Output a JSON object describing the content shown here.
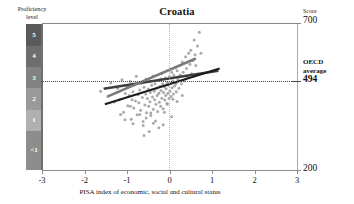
{
  "chart_data": {
    "type": "scatter",
    "title": "Croatia",
    "xlabel": "PISA index of economic, social and cultural status",
    "ylabel": "Score",
    "xlim": [
      -3,
      3
    ],
    "ylim": [
      200,
      700
    ],
    "grid": false,
    "legend": "none",
    "xticks": [
      "-3",
      "-2",
      "-1",
      "0",
      "1",
      "2",
      "3"
    ],
    "xtick_values": [
      -3,
      -2,
      -1,
      0,
      1,
      2,
      3
    ],
    "yticks": [
      "700",
      "494",
      "200"
    ],
    "ytick_values": [
      700,
      494,
      200
    ],
    "annotations": {
      "oecd_average_line": 494,
      "zero_reference_line": 0
    },
    "proficiency_axis_label": "Proficiency level",
    "proficiency_levels": [
      {
        "label": "5",
        "top_score": 700,
        "bottom_score": 626,
        "color": "#5a5a5a"
      },
      {
        "label": "4",
        "top_score": 626,
        "bottom_score": 553,
        "color": "#6e6e6e"
      },
      {
        "label": "3",
        "top_score": 553,
        "bottom_score": 480,
        "color": "#828282"
      },
      {
        "label": "2",
        "top_score": 480,
        "bottom_score": 407,
        "color": "#9a9a9a"
      },
      {
        "label": "1",
        "top_score": 407,
        "bottom_score": 335,
        "color": "#b0b0b0"
      },
      {
        "label": "<1",
        "top_score": 335,
        "bottom_score": 200,
        "color": "#8d8d8d"
      }
    ],
    "series": [
      {
        "name": "students",
        "type": "scatter",
        "marker_color": "#9b9b9b",
        "points": [
          [
            -1.62,
            470
          ],
          [
            -1.45,
            452
          ],
          [
            -1.38,
            498
          ],
          [
            -1.3,
            433
          ],
          [
            -1.22,
            479
          ],
          [
            -1.18,
            441
          ],
          [
            -1.12,
            509
          ],
          [
            -1.08,
            398
          ],
          [
            -1.04,
            462
          ],
          [
            -1.0,
            487
          ],
          [
            -0.98,
            420
          ],
          [
            -0.95,
            455
          ],
          [
            -0.92,
            503
          ],
          [
            -0.9,
            374
          ],
          [
            -0.88,
            441
          ],
          [
            -0.86,
            468
          ],
          [
            -0.84,
            412
          ],
          [
            -0.82,
            492
          ],
          [
            -0.8,
            436
          ],
          [
            -0.78,
            521
          ],
          [
            -0.76,
            389
          ],
          [
            -0.74,
            458
          ],
          [
            -0.72,
            430
          ],
          [
            -0.7,
            474
          ],
          [
            -0.68,
            405
          ],
          [
            -0.66,
            497
          ],
          [
            -0.64,
            448
          ],
          [
            -0.62,
            366
          ],
          [
            -0.6,
            483
          ],
          [
            -0.58,
            423
          ],
          [
            -0.56,
            460
          ],
          [
            -0.55,
            512
          ],
          [
            -0.54,
            396
          ],
          [
            -0.52,
            445
          ],
          [
            -0.5,
            477
          ],
          [
            -0.49,
            418
          ],
          [
            -0.48,
            503
          ],
          [
            -0.46,
            434
          ],
          [
            -0.45,
            465
          ],
          [
            -0.44,
            387
          ],
          [
            -0.42,
            490
          ],
          [
            -0.4,
            450
          ],
          [
            -0.39,
            522
          ],
          [
            -0.38,
            408
          ],
          [
            -0.36,
            470
          ],
          [
            -0.35,
            441
          ],
          [
            -0.34,
            495
          ],
          [
            -0.32,
            425
          ],
          [
            -0.3,
            480
          ],
          [
            -0.29,
            455
          ],
          [
            -0.28,
            400
          ],
          [
            -0.26,
            508
          ],
          [
            -0.25,
            463
          ],
          [
            -0.24,
            432
          ],
          [
            -0.22,
            487
          ],
          [
            -0.21,
            418
          ],
          [
            -0.2,
            472
          ],
          [
            -0.19,
            530
          ],
          [
            -0.18,
            446
          ],
          [
            -0.16,
            495
          ],
          [
            -0.15,
            410
          ],
          [
            -0.14,
            465
          ],
          [
            -0.12,
            485
          ],
          [
            -0.11,
            440
          ],
          [
            -0.1,
            515
          ],
          [
            -0.09,
            455
          ],
          [
            -0.08,
            478
          ],
          [
            -0.06,
            428
          ],
          [
            -0.05,
            500
          ],
          [
            -0.04,
            462
          ],
          [
            -0.02,
            490
          ],
          [
            -0.01,
            445
          ],
          [
            0.0,
            520
          ],
          [
            0.01,
            470
          ],
          [
            0.02,
            498
          ],
          [
            0.04,
            452
          ],
          [
            0.05,
            535
          ],
          [
            0.06,
            482
          ],
          [
            0.08,
            505
          ],
          [
            0.09,
            460
          ],
          [
            0.1,
            525
          ],
          [
            0.12,
            488
          ],
          [
            0.14,
            550
          ],
          [
            0.15,
            495
          ],
          [
            0.16,
            468
          ],
          [
            0.18,
            540
          ],
          [
            0.2,
            510
          ],
          [
            0.22,
            480
          ],
          [
            0.24,
            558
          ],
          [
            0.25,
            525
          ],
          [
            0.28,
            495
          ],
          [
            0.3,
            570
          ],
          [
            0.32,
            535
          ],
          [
            0.35,
            505
          ],
          [
            0.38,
            588
          ],
          [
            0.4,
            548
          ],
          [
            0.42,
            518
          ],
          [
            0.45,
            600
          ],
          [
            0.48,
            562
          ],
          [
            0.5,
            610
          ],
          [
            0.52,
            530
          ],
          [
            0.55,
            575
          ],
          [
            0.58,
            645
          ],
          [
            0.6,
            595
          ],
          [
            0.62,
            558
          ],
          [
            0.66,
            625
          ],
          [
            0.7,
            672
          ],
          [
            0.74,
            600
          ],
          [
            0.3,
            455
          ],
          [
            0.18,
            435
          ],
          [
            -0.55,
            378
          ],
          [
            -0.62,
            352
          ],
          [
            -0.38,
            360
          ],
          [
            -0.25,
            345
          ],
          [
            -0.7,
            390
          ],
          [
            -0.86,
            358
          ],
          [
            -1.05,
            372
          ],
          [
            -0.48,
            332
          ],
          [
            -0.33,
            368
          ],
          [
            -0.15,
            355
          ],
          [
            0.05,
            382
          ],
          [
            -0.12,
            398
          ],
          [
            -0.6,
            318
          ],
          [
            -0.44,
            395
          ],
          [
            -0.92,
            418
          ],
          [
            -1.15,
            390
          ],
          [
            -1.25,
            465
          ],
          [
            -0.2,
            512
          ],
          [
            0.08,
            442
          ],
          [
            -0.05,
            425
          ]
        ]
      },
      {
        "name": "within-school gradient",
        "type": "line",
        "color": "#3d3d3d",
        "x": [
          -1.55,
          1.15
        ],
        "y": [
          478,
          540
        ]
      },
      {
        "name": "overall gradient",
        "type": "line",
        "color": "#1b1b1b",
        "x": [
          -1.52,
          1.18
        ],
        "y": [
          425,
          548
        ]
      },
      {
        "name": "between-school gradient",
        "type": "line",
        "color": "#7a7a7a",
        "x": [
          -1.45,
          0.62
        ],
        "y": [
          452,
          582
        ]
      }
    ]
  },
  "right_labels": {
    "score_caption": "Score",
    "score_max": "700",
    "score_min": "200",
    "oecd_line1": "OECD",
    "oecd_line2": "average",
    "oecd_value": "494"
  },
  "left_labels": {
    "header_line1": "Proficiency",
    "header_line2": "level"
  }
}
